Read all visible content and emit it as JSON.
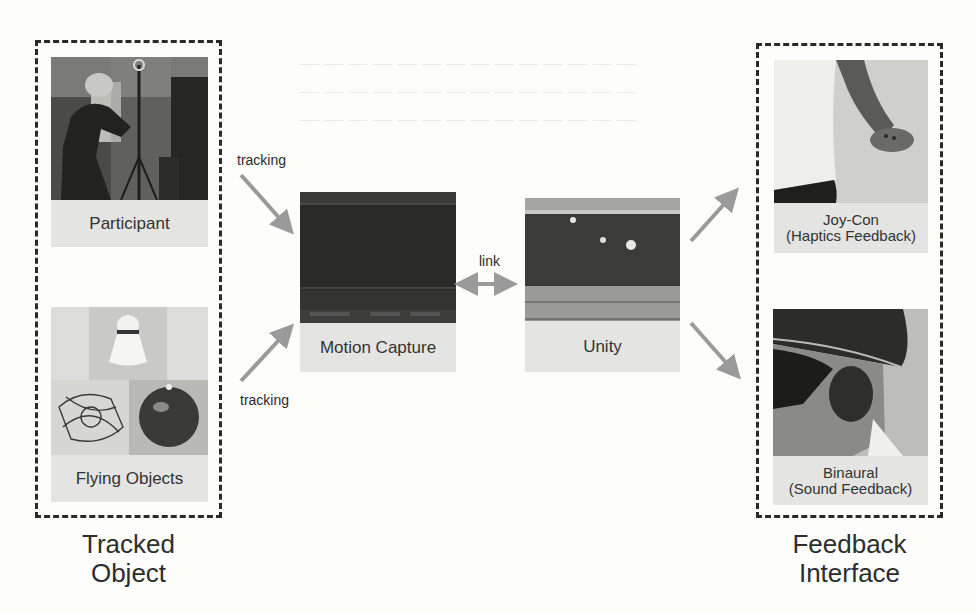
{
  "page_header": {
    "running_title": "——————",
    "page_number": "———"
  },
  "diagram": {
    "groups": {
      "tracked_object": {
        "label": "Tracked\nObject",
        "line1": "Tracked",
        "line2": "Object"
      },
      "feedback_interface": {
        "label": "Feedback\nInterface",
        "line1": "Feedback",
        "line2": "Interface"
      }
    },
    "nodes": {
      "participant": {
        "caption": "Participant",
        "image": "photo of participant wearing tracking helmet beside camera tripod"
      },
      "flying_objects": {
        "caption": "Flying Objects",
        "image": "photos of shuttlecock, caged drone and ball with markers"
      },
      "motion_capture": {
        "caption": "Motion Capture",
        "image": "motion capture software screenshot"
      },
      "unity": {
        "caption": "Unity",
        "image": "Unity editor screenshot with tracked objects"
      },
      "joycon": {
        "caption_line1": "Joy-Con",
        "caption_line2": "(Haptics Feedback)",
        "image": "hand holding Joy-Con controller"
      },
      "binaural": {
        "caption_line1": "Binaural",
        "caption_line2": "(Sound Feedback)",
        "image": "participant with helmet and blindfold"
      }
    },
    "edges": [
      {
        "from": "participant",
        "to": "motion_capture",
        "label": "tracking",
        "style": "arrow"
      },
      {
        "from": "flying_objects",
        "to": "motion_capture",
        "label": "tracking",
        "style": "arrow"
      },
      {
        "from": "motion_capture",
        "to": "unity",
        "label": "link",
        "style": "double-arrow"
      },
      {
        "from": "unity",
        "to": "joycon",
        "label": "",
        "style": "arrow"
      },
      {
        "from": "unity",
        "to": "binaural",
        "label": "",
        "style": "arrow"
      }
    ],
    "colors": {
      "arrow": "#9a9a9a",
      "dash_border": "#2a2a2a",
      "caption_bg": "#e4e4e2",
      "text": "#2d2d2d"
    }
  }
}
